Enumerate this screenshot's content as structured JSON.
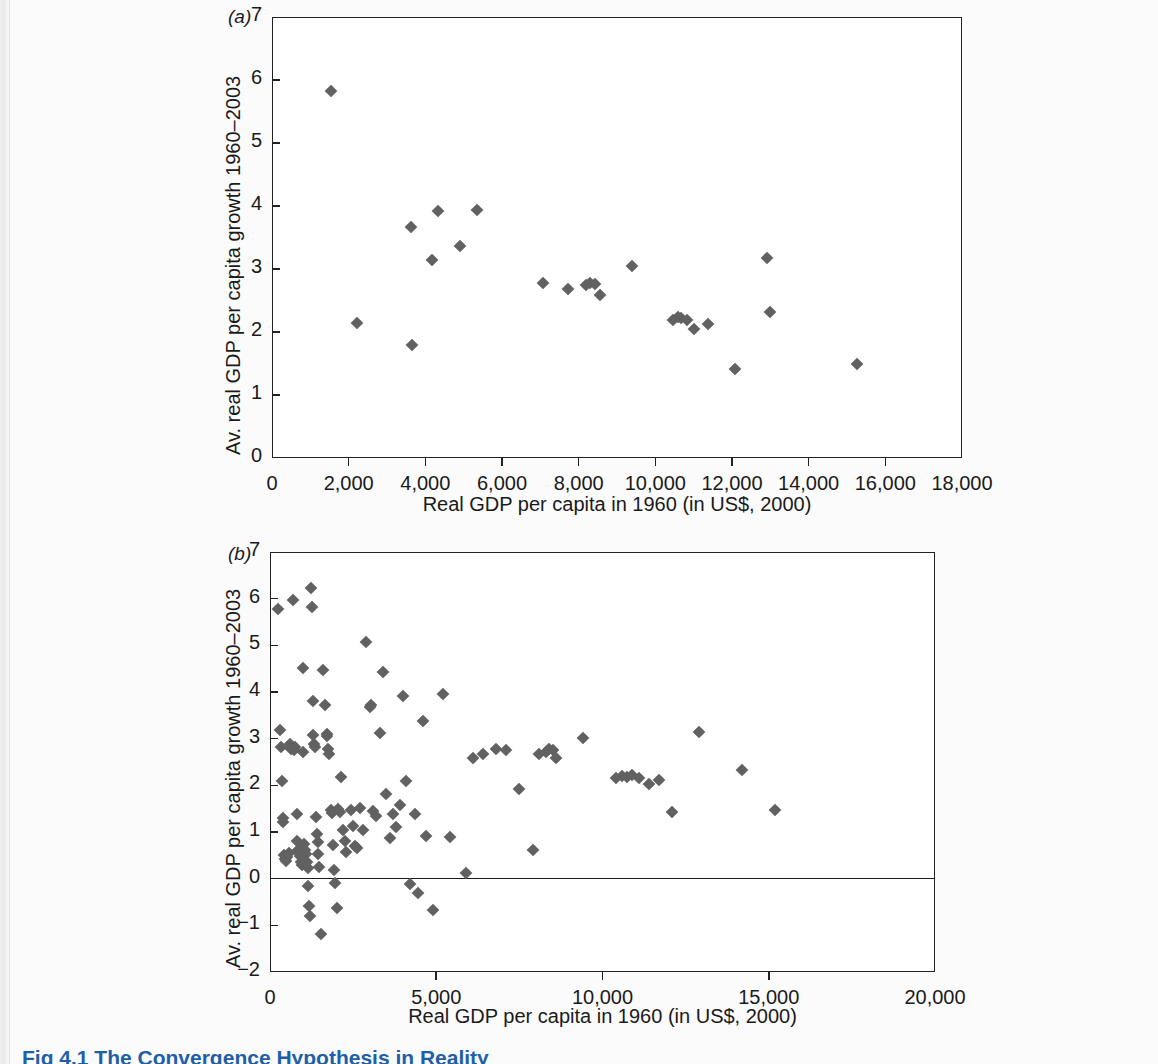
{
  "page": {
    "background_color": "#fbfbfb",
    "marker_color": "#616161",
    "axis_color": "#222222",
    "caption_color": "#1f5fa9"
  },
  "caption": {
    "text": "Fig 4.1 The Convergence Hypothesis in Reality"
  },
  "chart_data": [
    {
      "id": "panel-a",
      "type": "scatter",
      "panel_label": "(a)",
      "title": "",
      "xlabel": "Real GDP per capita in 1960 (in US$, 2000)",
      "ylabel": "Av. real GDP per capita growth 1960–2003",
      "xlim": [
        0,
        18000
      ],
      "ylim": [
        0,
        7
      ],
      "xticks": [
        0,
        2000,
        4000,
        6000,
        8000,
        10000,
        12000,
        14000,
        16000,
        18000
      ],
      "xticklabels": [
        "0",
        "2,000",
        "4,000",
        "6,000",
        "8,000",
        "10,000",
        "12,000",
        "14,000",
        "16,000",
        "18,000"
      ],
      "yticks": [
        0,
        1,
        2,
        3,
        4,
        5,
        6,
        7
      ],
      "yticklabels": [
        "0",
        "1",
        "2",
        "3",
        "4",
        "5",
        "6",
        "7"
      ],
      "grid": false,
      "legend": "none",
      "marker": "diamond",
      "points": [
        [
          1530,
          5.83
        ],
        [
          2230,
          2.15
        ],
        [
          3620,
          3.67
        ],
        [
          3660,
          1.8
        ],
        [
          4180,
          3.15
        ],
        [
          4330,
          3.92
        ],
        [
          4900,
          3.37
        ],
        [
          5340,
          3.94
        ],
        [
          7080,
          2.77
        ],
        [
          7720,
          2.68
        ],
        [
          8180,
          2.74
        ],
        [
          8300,
          2.78
        ],
        [
          8420,
          2.76
        ],
        [
          8560,
          2.59
        ],
        [
          9380,
          3.05
        ],
        [
          10450,
          2.19
        ],
        [
          10580,
          2.24
        ],
        [
          10680,
          2.22
        ],
        [
          10820,
          2.19
        ],
        [
          11000,
          2.05
        ],
        [
          11380,
          2.12
        ],
        [
          12080,
          1.42
        ],
        [
          12900,
          3.17
        ],
        [
          12980,
          2.32
        ],
        [
          15250,
          1.49
        ]
      ]
    },
    {
      "id": "panel-b",
      "type": "scatter",
      "panel_label": "(b)",
      "title": "",
      "xlabel": "Real GDP per capita in 1960 (in US$, 2000)",
      "ylabel": "Av. real GDP per capita growth 1960–2003",
      "xlim": [
        0,
        20000
      ],
      "ylim": [
        -2,
        7
      ],
      "xticks": [
        0,
        5000,
        10000,
        15000,
        20000
      ],
      "xticklabels": [
        "0",
        "5,000",
        "10,000",
        "15,000",
        "20,000"
      ],
      "yticks": [
        -2,
        -1,
        0,
        1,
        2,
        3,
        4,
        5,
        6,
        7
      ],
      "yticklabels": [
        "−2",
        "−1",
        "0",
        "1",
        "2",
        "3",
        "4",
        "5",
        "6",
        "7"
      ],
      "grid": false,
      "zero_line": 0,
      "legend": "none",
      "marker": "diamond",
      "points": [
        [
          250,
          5.78
        ],
        [
          300,
          3.18
        ],
        [
          320,
          2.82
        ],
        [
          350,
          2.1
        ],
        [
          380,
          1.3
        ],
        [
          400,
          1.22
        ],
        [
          430,
          0.5
        ],
        [
          450,
          0.42
        ],
        [
          480,
          0.38
        ],
        [
          520,
          0.46
        ],
        [
          560,
          0.55
        ],
        [
          600,
          2.88
        ],
        [
          640,
          2.78
        ],
        [
          700,
          5.98
        ],
        [
          720,
          2.76
        ],
        [
          760,
          2.82
        ],
        [
          800,
          1.38
        ],
        [
          820,
          0.8
        ],
        [
          850,
          0.62
        ],
        [
          880,
          0.55
        ],
        [
          900,
          0.48
        ],
        [
          920,
          0.35
        ],
        [
          950,
          0.3
        ],
        [
          980,
          2.72
        ],
        [
          1000,
          4.52
        ],
        [
          1020,
          0.75
        ],
        [
          1050,
          0.62
        ],
        [
          1080,
          0.52
        ],
        [
          1100,
          0.35
        ],
        [
          1130,
          0.22
        ],
        [
          1150,
          -0.15
        ],
        [
          1180,
          -0.58
        ],
        [
          1200,
          -0.8
        ],
        [
          1230,
          6.22
        ],
        [
          1260,
          5.82
        ],
        [
          1280,
          3.8
        ],
        [
          1300,
          3.08
        ],
        [
          1320,
          2.88
        ],
        [
          1350,
          2.82
        ],
        [
          1380,
          1.32
        ],
        [
          1400,
          0.95
        ],
        [
          1430,
          0.78
        ],
        [
          1450,
          0.52
        ],
        [
          1480,
          0.25
        ],
        [
          1520,
          -1.18
        ],
        [
          1600,
          4.48
        ],
        [
          1650,
          3.72
        ],
        [
          1700,
          3.1
        ],
        [
          1720,
          3.05
        ],
        [
          1750,
          2.78
        ],
        [
          1780,
          2.68
        ],
        [
          1820,
          1.48
        ],
        [
          1850,
          1.4
        ],
        [
          1880,
          0.72
        ],
        [
          1920,
          0.18
        ],
        [
          1950,
          -0.1
        ],
        [
          2000,
          -0.62
        ],
        [
          2050,
          1.5
        ],
        [
          2100,
          1.42
        ],
        [
          2150,
          2.18
        ],
        [
          2200,
          1.05
        ],
        [
          2250,
          0.8
        ],
        [
          2300,
          0.58
        ],
        [
          2450,
          1.48
        ],
        [
          2500,
          1.12
        ],
        [
          2550,
          0.7
        ],
        [
          2620,
          0.65
        ],
        [
          2700,
          1.52
        ],
        [
          2800,
          1.05
        ],
        [
          2900,
          5.08
        ],
        [
          3000,
          3.68
        ],
        [
          3050,
          3.72
        ],
        [
          3100,
          1.45
        ],
        [
          3200,
          1.35
        ],
        [
          3300,
          3.12
        ],
        [
          3400,
          4.42
        ],
        [
          3500,
          1.82
        ],
        [
          3600,
          0.88
        ],
        [
          3700,
          1.38
        ],
        [
          3800,
          1.1
        ],
        [
          3900,
          1.58
        ],
        [
          4000,
          3.92
        ],
        [
          4100,
          2.1
        ],
        [
          4200,
          -0.12
        ],
        [
          4350,
          1.38
        ],
        [
          4450,
          -0.3
        ],
        [
          4600,
          3.38
        ],
        [
          4700,
          0.92
        ],
        [
          4900,
          -0.68
        ],
        [
          5200,
          3.95
        ],
        [
          5400,
          0.9
        ],
        [
          5900,
          0.12
        ],
        [
          6100,
          2.58
        ],
        [
          6400,
          2.68
        ],
        [
          6800,
          2.78
        ],
        [
          7100,
          2.75
        ],
        [
          7500,
          1.92
        ],
        [
          7900,
          0.62
        ],
        [
          8100,
          2.68
        ],
        [
          8300,
          2.72
        ],
        [
          8400,
          2.78
        ],
        [
          8500,
          2.75
        ],
        [
          8600,
          2.58
        ],
        [
          9400,
          3.02
        ],
        [
          10400,
          2.15
        ],
        [
          10600,
          2.2
        ],
        [
          10750,
          2.18
        ],
        [
          10900,
          2.22
        ],
        [
          11100,
          2.15
        ],
        [
          11400,
          2.02
        ],
        [
          11700,
          2.12
        ],
        [
          12100,
          1.42
        ],
        [
          12900,
          3.15
        ],
        [
          14200,
          2.32
        ],
        [
          15200,
          1.48
        ]
      ]
    }
  ]
}
